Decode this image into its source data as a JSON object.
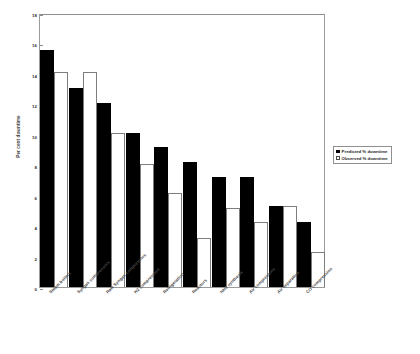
{
  "chart_data": {
    "type": "bar",
    "title": "",
    "xlabel": "",
    "ylabel": "Per cent downtime",
    "ylim": [
      0,
      18
    ],
    "ytick_step": 2,
    "yticks": [
      "0",
      "2",
      "4",
      "6",
      "8",
      "10",
      "12",
      "14",
      "16",
      "18"
    ],
    "grid": false,
    "legend_position": "right",
    "categories": [
      "Steam boilers",
      "Syngas compressors",
      "Raw Syngas compressors",
      "H2 compression",
      "Refrigeration",
      "Reactors",
      "NH3 synthesis",
      "Air compressors",
      "Air separation",
      "CO compression"
    ],
    "series": [
      {
        "name": "Predicted % downtime",
        "color": "#000000",
        "style": "filled",
        "values": [
          15.6,
          13.1,
          12.1,
          10.1,
          9.2,
          8.2,
          7.2,
          7.25,
          5.3,
          4.3
        ]
      },
      {
        "name": "Observed % downtime",
        "color": "#ffffff",
        "style": "open",
        "values": [
          14.1,
          14.1,
          10.1,
          8.1,
          6.2,
          3.2,
          5.2,
          4.25,
          5.3,
          2.3
        ]
      }
    ]
  },
  "legend": {
    "items": [
      {
        "label": "Predicted % downtime",
        "swatch": "filled-square-icon"
      },
      {
        "label": "Observed % downtime",
        "swatch": "open-square-icon"
      }
    ]
  }
}
